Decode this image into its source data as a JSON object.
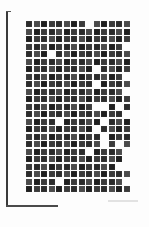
{
  "page": {
    "type": "scanned-page",
    "grid": {
      "columns": 14,
      "rows": 23,
      "blank_cells": [
        [
          0,
          8
        ],
        [
          3,
          13
        ],
        [
          4,
          3
        ],
        [
          6,
          9
        ],
        [
          7,
          13
        ],
        [
          8,
          9
        ],
        [
          9,
          13
        ],
        [
          11,
          9
        ],
        [
          11,
          10
        ],
        [
          11,
          12
        ],
        [
          12,
          13
        ],
        [
          13,
          4
        ],
        [
          13,
          10
        ],
        [
          14,
          9
        ],
        [
          15,
          10
        ],
        [
          16,
          10
        ],
        [
          16,
          12
        ],
        [
          17,
          8
        ],
        [
          17,
          13
        ],
        [
          18,
          13
        ],
        [
          19,
          12
        ],
        [
          19,
          13
        ],
        [
          21,
          4
        ],
        [
          21,
          13
        ]
      ]
    },
    "footer": {
      "text": ""
    }
  }
}
